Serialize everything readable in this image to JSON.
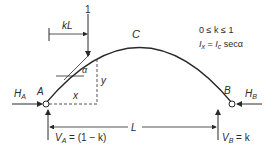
{
  "diagram": {
    "type": "two-hinged parabolic arch with point load",
    "labels": {
      "load": "1",
      "load_distance": "kL",
      "crown": "C",
      "angle": "α",
      "y": "y",
      "x": "x",
      "support_a": "A",
      "support_b": "B",
      "span": "L",
      "ha_main": "H",
      "ha_sub": "A",
      "hb_main": "H",
      "hb_sub": "B",
      "va_main": "V",
      "va_sub": "A",
      "va_value": " = (1 − k)",
      "vb_main": "V",
      "vb_sub": "B",
      "vb_value": " = k"
    },
    "notes": {
      "line1": "0 ≤ k ≤ 1",
      "line2_ix": "I",
      "line2_ix_sub": "x",
      "line2_mid": " = ",
      "line2_ic": "I",
      "line2_ic_sub": "c",
      "line2_end": " secα"
    },
    "colors": {
      "stroke": "#2a2a2a",
      "background": "#ffffff"
    }
  }
}
